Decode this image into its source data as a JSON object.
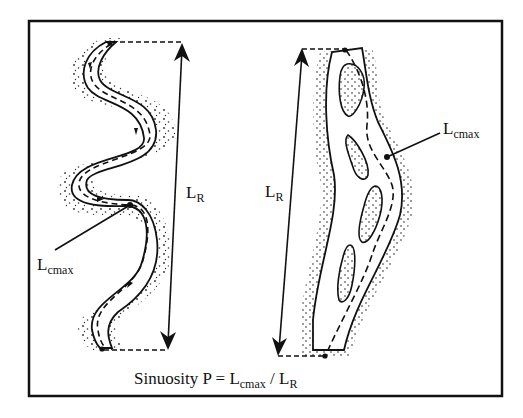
{
  "figure": {
    "frame_color": "#111111",
    "background": "#ffffff",
    "left_panel": {
      "description": "single-thread meandering channel",
      "channel_length_label": "L",
      "channel_length_sub": "cmax",
      "reach_length_label": "L",
      "reach_length_sub": "R"
    },
    "right_panel": {
      "description": "braided / anabranching channel with islands",
      "channel_length_label": "L",
      "channel_length_sub": "cmax",
      "reach_length_label": "L",
      "reach_length_sub": "R"
    },
    "caption": {
      "prefix": "Sinuosity P = L",
      "sub1": "cmax",
      "mid": " / L",
      "sub2": "R"
    }
  }
}
